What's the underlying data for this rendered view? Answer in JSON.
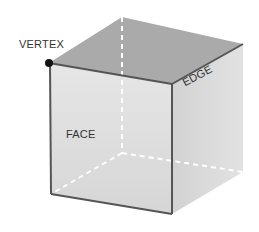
{
  "diagram": {
    "labels": {
      "vertex": "VERTEX",
      "edge": "EDGE",
      "face": "FACE"
    },
    "colors": {
      "top_face": "#a9a9a9",
      "front_face": "#dcdcdc",
      "side_face": "#cfcfcf",
      "edge_line": "#555555",
      "hidden_edge": "#ffffff",
      "vertex_dot": "#111111",
      "label_text": "#333333"
    }
  }
}
